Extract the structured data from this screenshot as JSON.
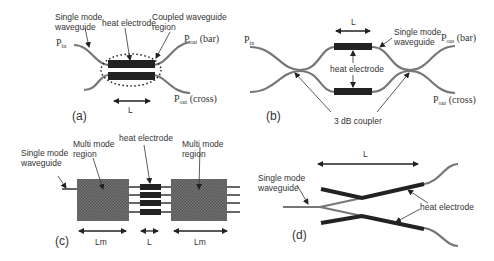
{
  "figure": {
    "panels": [
      {
        "id": "a",
        "label": "(a)",
        "labels": {
          "single_mode_1": "Single mode",
          "single_mode_2": "waveguide",
          "heat_electrode": "heat electrode",
          "coupled_1": "Coupled waveguide",
          "coupled_2": "region",
          "pin": "P",
          "pin_sub": "in",
          "pout_bar": "P",
          "pout_bar_sub": "out",
          "pout_bar_suffix": " (bar)",
          "pout_cross": "P",
          "pout_cross_sub": "out",
          "pout_cross_suffix": " (cross)",
          "length": "L"
        }
      },
      {
        "id": "b",
        "label": "(b)",
        "labels": {
          "pin": "P",
          "pin_sub": "in",
          "length": "L",
          "single_mode_1": "Single mode",
          "single_mode_2": "waveguide",
          "pout_bar": "P",
          "pout_bar_sub": "out",
          "pout_bar_suffix": " (bar)",
          "heat_electrode": "heat electrode",
          "pout_cross": "P",
          "pout_cross_sub": "out",
          "pout_cross_suffix": " (cross)",
          "coupler": "3 dB coupler"
        }
      },
      {
        "id": "c",
        "label": "(c)",
        "labels": {
          "single_mode_1": "Single mode",
          "single_mode_2": "waveguide",
          "multi_mode_left_1": "Multi mode",
          "multi_mode_left_2": "region",
          "heat_electrode": "heat electrode",
          "multi_mode_right_1": "Multi mode",
          "multi_mode_right_2": "region",
          "lm_left": "Lm",
          "length": "L",
          "lm_right": "Lm"
        }
      },
      {
        "id": "d",
        "label": "(d)",
        "labels": {
          "length": "L",
          "single_mode_1": "Single mode",
          "single_mode_2": "waveguide",
          "heat_electrode": "heat electrode"
        }
      }
    ]
  }
}
